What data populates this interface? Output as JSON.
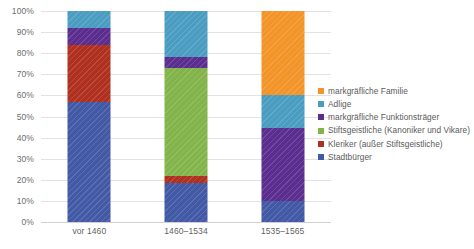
{
  "chart_data": {
    "type": "bar",
    "subtype": "stacked-100-percent",
    "title": "",
    "xlabel": "",
    "ylabel": "",
    "ylim": [
      0,
      100
    ],
    "ytick_labels": [
      "100%",
      "90%",
      "80%",
      "70%",
      "60%",
      "50%",
      "40%",
      "30%",
      "20%",
      "10%",
      "0%"
    ],
    "ytick_values": [
      100,
      90,
      80,
      70,
      60,
      50,
      40,
      30,
      20,
      10,
      0
    ],
    "grid": true,
    "legend_position": "right",
    "categories": [
      "vor 1460",
      "1460–1534",
      "1535–1565"
    ],
    "series": [
      {
        "name": "Stadtbürger",
        "color": "#4259a5",
        "values": [
          57.0,
          18.5,
          10.0
        ]
      },
      {
        "name": "Kleriker (außer Stiftsgeistliche)",
        "color": "#b03020",
        "values": [
          27.0,
          3.5,
          0.0
        ]
      },
      {
        "name": "Stiftsgeistliche (Kanoniker und Vikare)",
        "color": "#82b44a",
        "values": [
          0.0,
          51.0,
          0.0
        ]
      },
      {
        "name": "markgräfliche Funktionsträger",
        "color": "#5b2d8e",
        "values": [
          8.0,
          5.0,
          34.5
        ]
      },
      {
        "name": "Adlige",
        "color": "#4a9dc0",
        "values": [
          8.0,
          22.0,
          15.5
        ]
      },
      {
        "name": "markgräfliche Familie",
        "color": "#f39428",
        "values": [
          0.0,
          0.0,
          40.0
        ]
      }
    ]
  },
  "legend": {
    "items": [
      {
        "label": "markgräfliche Familie",
        "color": "#f39428"
      },
      {
        "label": "Adlige",
        "color": "#4a9dc0"
      },
      {
        "label": "markgräfliche Funktionsträger",
        "color": "#5b2d8e"
      },
      {
        "label": "Stiftsgeistliche (Kanoniker und Vikare)",
        "color": "#82b44a"
      },
      {
        "label": "Kleriker (außer Stiftsgeistliche)",
        "color": "#b03020"
      },
      {
        "label": "Stadtbürger",
        "color": "#4259a5"
      }
    ]
  }
}
